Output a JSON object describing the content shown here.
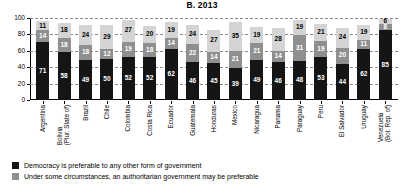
{
  "chart_data": {
    "type": "bar",
    "title": "B. 2013",
    "xlabel": "",
    "ylabel": "",
    "ylim": [
      0,
      100
    ],
    "yticks": [
      0,
      20,
      40,
      60,
      80,
      100
    ],
    "grid": true,
    "stacked": true,
    "legend_position": "bottom-left",
    "categories": [
      "Argentina",
      "Bolivia (Plur. State of)",
      "Brazil",
      "Chile",
      "Colombia",
      "Costa Rica",
      "Ecuador",
      "Guatemala",
      "Honduras",
      "Mexico",
      "Nicaragua",
      "Panama",
      "Paraguay",
      "Peru",
      "El Salvador",
      "Uruguay",
      "Venezuela (Bol. Rep. of)"
    ],
    "category_labels": [
      {
        "main": "Argentina",
        "sub": ""
      },
      {
        "main": "Bolivia",
        "sub": "(Plur. State of)"
      },
      {
        "main": "Brazil",
        "sub": ""
      },
      {
        "main": "Chile",
        "sub": ""
      },
      {
        "main": "Colombia",
        "sub": ""
      },
      {
        "main": "Costa Rica",
        "sub": ""
      },
      {
        "main": "Ecuador",
        "sub": ""
      },
      {
        "main": "Guatemala",
        "sub": ""
      },
      {
        "main": "Honduras",
        "sub": ""
      },
      {
        "main": "Mexico",
        "sub": ""
      },
      {
        "main": "Nicaragua",
        "sub": ""
      },
      {
        "main": "Panama",
        "sub": ""
      },
      {
        "main": "Paraguay",
        "sub": ""
      },
      {
        "main": "Peru",
        "sub": ""
      },
      {
        "main": "El Salvador",
        "sub": ""
      },
      {
        "main": "Uruguay",
        "sub": ""
      },
      {
        "main": "Venezuela",
        "sub": "(Bol. Rep. of)"
      }
    ],
    "series": [
      {
        "name": "Democracy is preferable to any other form of government",
        "color": "#151515",
        "values": [
          71,
          58,
          49,
          50,
          52,
          52,
          62,
          46,
          45,
          39,
          49,
          46,
          48,
          53,
          44,
          62,
          85
        ]
      },
      {
        "name": "Under some circumstances, an authoritarian government may be preferable",
        "color": "#8f8f8f",
        "values": [
          14,
          18,
          18,
          12,
          19,
          18,
          14,
          22,
          14,
          21,
          21,
          14,
          31,
          19,
          20,
          11,
          8
        ]
      },
      {
        "name": "For people like me, it does not matter whether a regime is democratic or non-democratic",
        "color": "#d4d4d4",
        "values": [
          11,
          18,
          24,
          29,
          27,
          20,
          19,
          24,
          27,
          35,
          19,
          28,
          19,
          21,
          24,
          19,
          6
        ]
      }
    ]
  },
  "legend": {
    "items": [
      {
        "label": "Democracy is preferable to any other form of government",
        "swatch": "sw-democracy"
      },
      {
        "label": "Under some circumstances, an authoritarian government may be preferable",
        "swatch": "sw-authoritarian"
      }
    ]
  }
}
